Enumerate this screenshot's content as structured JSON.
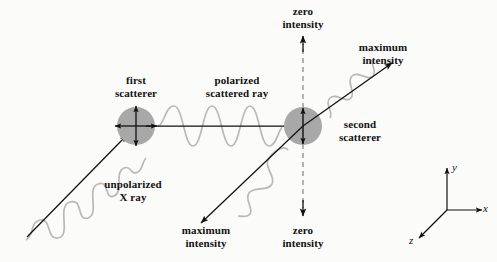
{
  "figure": {
    "background_color": "#fbfbfa",
    "ink_color": "#111111",
    "wave_color": "#b9b9b9",
    "scatterer_fill": "#a8a8a8",
    "dashed_color": "#9a9a9a"
  },
  "labels": {
    "first_scatterer": "first\nscatterer",
    "polarized_scattered_ray": "polarized\nscattered ray",
    "zero_intensity_top": "zero\nintensity",
    "maximum_intensity_top": "maximum\nintensity",
    "second_scatterer": "second\nscatterer",
    "unpolarized_x_ray": "unpolarized\nX ray",
    "maximum_intensity_bottom": "maximum\nintensity",
    "zero_intensity_bottom": "zero\nintensity"
  },
  "axes": {
    "x": "x",
    "y": "y",
    "z": "z",
    "origin": [
      447,
      210
    ]
  },
  "scatterers": [
    {
      "name": "first-scatterer",
      "center": [
        136,
        126
      ],
      "radius": 19,
      "oscillation": "unpolarized",
      "arrow_directions": [
        "up",
        "down",
        "left",
        "right"
      ]
    },
    {
      "name": "second-scatterer",
      "center": [
        303,
        126
      ],
      "radius": 19,
      "oscillation": "polarized-vertical",
      "arrow_directions": [
        "up",
        "down"
      ]
    }
  ],
  "rays": [
    {
      "name": "unpolarized-incident-ray",
      "from": [
        28,
        236
      ],
      "to": [
        128,
        134
      ],
      "wave": "irregular",
      "polarization": "unpolarized"
    },
    {
      "name": "polarized-scattered-ray",
      "from": [
        142,
        126
      ],
      "to": [
        292,
        126
      ],
      "wave": "sine",
      "polarization": "vertical"
    },
    {
      "name": "maximum-intensity-ray-upper-right",
      "from": [
        303,
        126
      ],
      "to": [
        394,
        62
      ],
      "wave": "sine",
      "intensity": "maximum"
    },
    {
      "name": "maximum-intensity-ray-lower-left",
      "from": [
        303,
        126
      ],
      "to": [
        199,
        225
      ],
      "wave": "sine",
      "intensity": "maximum"
    },
    {
      "name": "zero-intensity-ray-up",
      "from": [
        303,
        110
      ],
      "to": [
        303,
        36
      ],
      "style": "dashed",
      "intensity": "zero"
    },
    {
      "name": "zero-intensity-ray-down",
      "from": [
        303,
        142
      ],
      "to": [
        303,
        216
      ],
      "style": "dashed",
      "intensity": "zero"
    }
  ]
}
